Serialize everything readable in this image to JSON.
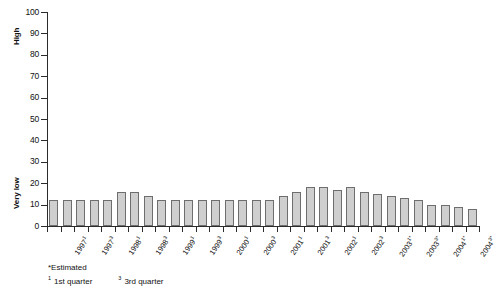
{
  "chart_data": {
    "type": "bar",
    "title": "",
    "xlabel": "",
    "ylabel": "",
    "ylim": [
      0,
      100
    ],
    "yticks": [
      0,
      10,
      20,
      30,
      40,
      50,
      60,
      70,
      80,
      90,
      100
    ],
    "grid": false,
    "legend": null,
    "y_axis_captions": [
      {
        "text": "High",
        "near_value": 90
      },
      {
        "text": "Very low",
        "near_value": 20
      }
    ],
    "categories": [
      "1997¹",
      "",
      "1997³",
      "",
      "1998¹",
      "",
      "1998³",
      "",
      "1999¹",
      "",
      "1999³",
      "",
      "2000¹",
      "",
      "2000³",
      "",
      "2001¹",
      "",
      "2001³",
      "",
      "2002¹",
      "",
      "2002³",
      "",
      "2003¹*",
      "",
      "2003³*",
      "",
      "2004¹*",
      "",
      "2004³*",
      ""
    ],
    "tick_labels": [
      {
        "base": "1997",
        "sup": "1",
        "bar_index": 0
      },
      {
        "base": "1997",
        "sup": "3",
        "bar_index": 2
      },
      {
        "base": "1998",
        "sup": "1",
        "bar_index": 4
      },
      {
        "base": "1998",
        "sup": "3",
        "bar_index": 6
      },
      {
        "base": "1999",
        "sup": "1",
        "bar_index": 8
      },
      {
        "base": "1999",
        "sup": "3",
        "bar_index": 10
      },
      {
        "base": "2000",
        "sup": "1",
        "bar_index": 12
      },
      {
        "base": "2000",
        "sup": "3",
        "bar_index": 14
      },
      {
        "base": "2001",
        "sup": "1",
        "bar_index": 16
      },
      {
        "base": "2001",
        "sup": "3",
        "bar_index": 18
      },
      {
        "base": "2002",
        "sup": "1",
        "bar_index": 20
      },
      {
        "base": "2002",
        "sup": "3",
        "bar_index": 22
      },
      {
        "base": "2003",
        "sup": "1*",
        "bar_index": 24
      },
      {
        "base": "2003",
        "sup": "3*",
        "bar_index": 26
      },
      {
        "base": "2004",
        "sup": "1*",
        "bar_index": 28
      },
      {
        "base": "2004",
        "sup": "3*",
        "bar_index": 30
      }
    ],
    "values": [
      12,
      12,
      12,
      12,
      12,
      16,
      16,
      14,
      12,
      12,
      12,
      12,
      12,
      12,
      12,
      12,
      12,
      14,
      16,
      18,
      18,
      17,
      18,
      16,
      15,
      14,
      13,
      12,
      10,
      10,
      9,
      8
    ],
    "bar_fill": "#cfcfcf",
    "bar_stroke": "#6e6e6e"
  },
  "footnotes": {
    "estimated": "*Estimated",
    "q1_sup": "1",
    "q1_text": "1st quarter",
    "q3_sup": "3",
    "q3_text": "3rd quarter"
  }
}
